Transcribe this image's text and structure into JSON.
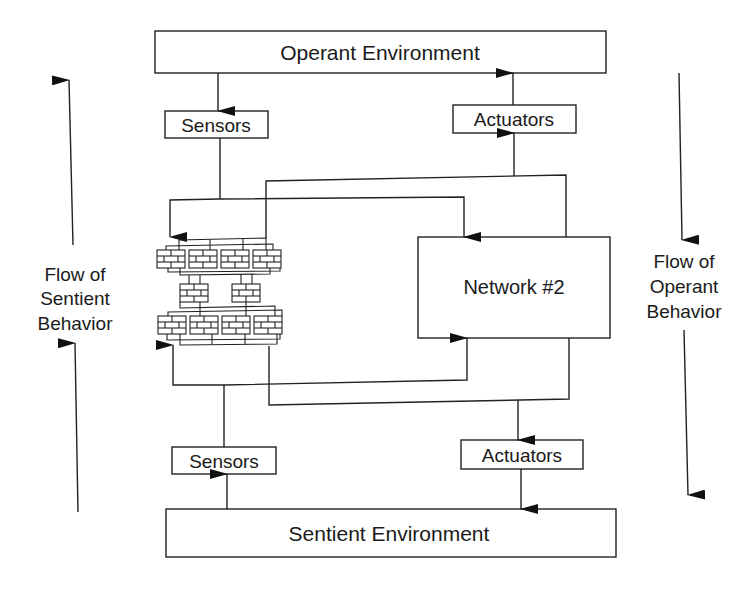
{
  "diagram": {
    "boxes": {
      "operant_environment": "Operant Environment",
      "sentient_environment": "Sentient Environment",
      "network_2": "Network #2",
      "sensors_top": "Sensors",
      "actuators_top": "Actuators",
      "sensors_bottom": "Sensors",
      "actuators_bottom": "Actuators"
    },
    "side_labels": {
      "left": [
        "Flow of",
        "Sentient",
        "Behavior"
      ],
      "right": [
        "Flow of",
        "Operant",
        "Behavior"
      ]
    },
    "network_1": {
      "description": "neural-network-mesh",
      "top_row_modules": 4,
      "middle_row_modules": 2,
      "bottom_row_modules": 4
    },
    "flows": [
      {
        "from": "operant_environment",
        "to": "sensors_top"
      },
      {
        "from": "sensors_top",
        "to": "network_1"
      },
      {
        "from": "sensors_top",
        "to": "network_2"
      },
      {
        "from": "network_1",
        "to": "actuators_top"
      },
      {
        "from": "network_2",
        "to": "actuators_top"
      },
      {
        "from": "actuators_top",
        "to": "operant_environment"
      },
      {
        "from": "sentient_environment",
        "to": "sensors_bottom"
      },
      {
        "from": "sensors_bottom",
        "to": "network_1"
      },
      {
        "from": "sensors_bottom",
        "to": "network_2"
      },
      {
        "from": "network_1",
        "to": "actuators_bottom"
      },
      {
        "from": "network_2",
        "to": "actuators_bottom"
      },
      {
        "from": "actuators_bottom",
        "to": "sentient_environment"
      }
    ]
  }
}
